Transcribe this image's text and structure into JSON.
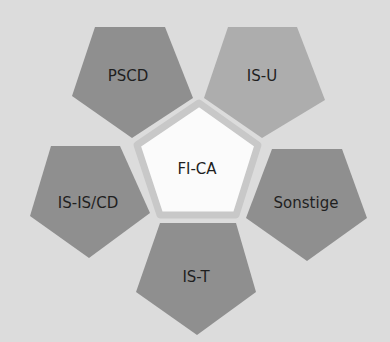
{
  "diagram": {
    "background": "#dcdcdc",
    "center": {
      "label": "FI-CA",
      "fill": "#fbfbfb",
      "stroke": "#c8c8c8",
      "points": "199,103 258,145 236,215 160,215 137,145",
      "text_x": 197,
      "text_y": 174
    },
    "nodes": [
      {
        "id": "pscd",
        "label": "PSCD",
        "fill": "#8f8f8f",
        "points": "95,27 165,27 193,98 132,138 72,96",
        "text_x": 128,
        "text_y": 81
      },
      {
        "id": "is-u",
        "label": "IS-U",
        "fill": "#adadad",
        "points": "228,27 297,27 325,100 262,138 204,98",
        "text_x": 262,
        "text_y": 81
      },
      {
        "id": "is-is-cd",
        "label": "IS-IS/CD",
        "fill": "#8f8f8f",
        "points": "51,146 120,146 150,213 89,258 30,216",
        "text_x": 88,
        "text_y": 208
      },
      {
        "id": "sonstige",
        "label": "Sonstige",
        "fill": "#8f8f8f",
        "points": "272,149 342,149 367,218 307,261 246,218",
        "text_x": 306,
        "text_y": 208
      },
      {
        "id": "is-t",
        "label": "IS-T",
        "fill": "#8f8f8f",
        "points": "160,223 236,223 256,292 197,335 136,292",
        "text_x": 196,
        "text_y": 282
      }
    ]
  }
}
